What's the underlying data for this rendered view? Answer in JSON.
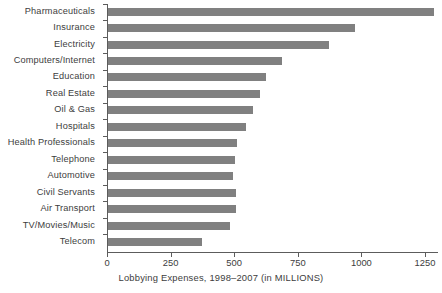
{
  "chart_data": {
    "type": "bar",
    "orientation": "horizontal",
    "title": "",
    "xlabel": "Lobbying Expenses, 1998–2007 (in MILLIONS)",
    "ylabel": "",
    "xlim": [
      0,
      1330
    ],
    "xticks": [
      0,
      250,
      500,
      750,
      1000,
      1250
    ],
    "xtick_labels": [
      "0",
      "250",
      "500",
      "750",
      "1000",
      "1250"
    ],
    "grid": false,
    "legend": false,
    "bar_color": "#808080",
    "axis_color": "#5c5c5c",
    "categories": [
      "Pharmaceuticals",
      "Insurance",
      "Electricity",
      "Computers/Internet",
      "Education",
      "Real Estate",
      "Oil & Gas",
      "Hospitals",
      "Health Professionals",
      "Telephone",
      "Automotive",
      "Civil Servants",
      "Air Transport",
      "TV/Movies/Music",
      "Telecom"
    ],
    "values": [
      1280,
      971,
      868,
      684,
      621,
      598,
      570,
      542,
      507,
      499,
      491,
      503,
      503,
      480,
      370
    ]
  }
}
